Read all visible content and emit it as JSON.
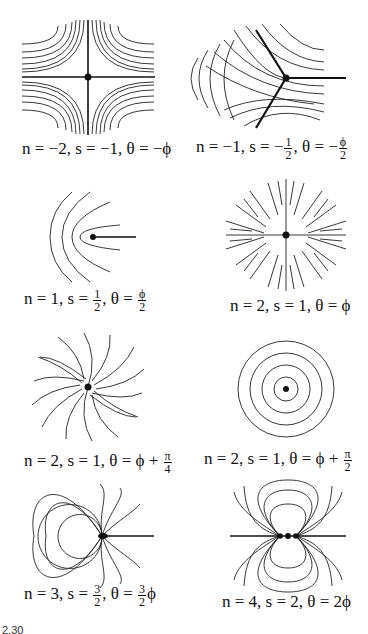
{
  "figure": {
    "label_fragment": "2.30",
    "panels": [
      {
        "id": "p1",
        "caption": {
          "n": "n = −2, ",
          "s": "s = −1, ",
          "theta": "θ = −ϕ"
        }
      },
      {
        "id": "p2",
        "caption": {
          "n": "n = −1, ",
          "s_pre": "s = −",
          "s_num": "1",
          "s_den": "2",
          "theta_pre": ", θ = −",
          "theta_num": "ϕ",
          "theta_den": "2"
        }
      },
      {
        "id": "p3",
        "caption": {
          "n": "n = 1, ",
          "s_pre": "s = ",
          "s_num": "1",
          "s_den": "2",
          "theta_pre": ", θ = ",
          "theta_num": "ϕ",
          "theta_den": "2"
        }
      },
      {
        "id": "p4",
        "caption": {
          "text": "n = 2, s = 1, θ = ϕ"
        }
      },
      {
        "id": "p5",
        "caption": {
          "pre": "n = 2, s = 1, θ = ϕ + ",
          "num": "π",
          "den": "4"
        }
      },
      {
        "id": "p6",
        "caption": {
          "pre": "n = 2, s = 1, θ = ϕ + ",
          "num": "π",
          "den": "2"
        }
      },
      {
        "id": "p7",
        "caption": {
          "n": "n = 3, ",
          "s_pre": "s = ",
          "s_num": "3",
          "s_den": "2",
          "theta_pre": ", θ = ",
          "theta_num": "3",
          "theta_den": "2",
          "theta_post": "ϕ"
        }
      },
      {
        "id": "p8",
        "caption": {
          "text": "n = 4, s = 2, θ = 2ϕ"
        }
      }
    ]
  }
}
